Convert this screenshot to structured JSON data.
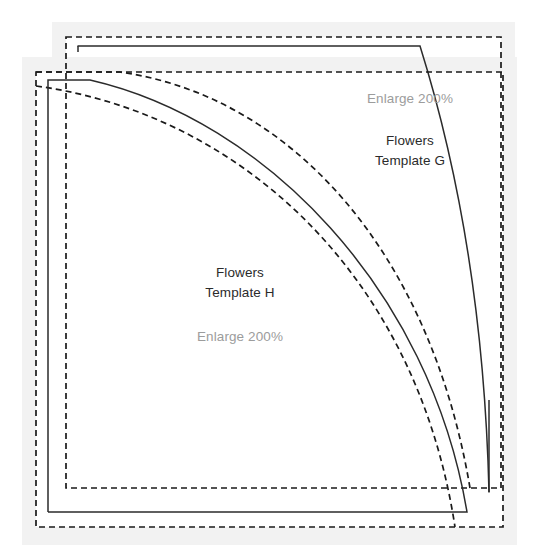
{
  "diagram": {
    "type": "sewing-pattern-template-sheet",
    "colors": {
      "sheet_background": "#f2f2f2",
      "page_background": "#ffffff",
      "stroke": "#2b2b2b",
      "dashed_stroke": "#1a1a1a",
      "title_text": "#2b2b2b",
      "note_text": "#9c9c9c"
    },
    "sheets": [
      {
        "id": "sheet-g",
        "name": "template-sheet-g",
        "title_line1": "Flowers",
        "title_line2": "Template G",
        "note": "Enlarge 200%",
        "paper": {
          "x": 52,
          "y": 22,
          "width": 463,
          "height": 487
        },
        "cut_border": {
          "x": 66,
          "y": 37,
          "width": 435,
          "height": 451
        },
        "solid_corner": {
          "x": 78,
          "y": 46,
          "width": 411,
          "height": 446
        }
      },
      {
        "id": "sheet-h",
        "name": "template-sheet-h",
        "title_line1": "Flowers",
        "title_line2": "Template H",
        "note": "Enlarge 200%",
        "paper": {
          "x": 22,
          "y": 57,
          "width": 495,
          "height": 488
        },
        "cut_border": {
          "x": 36,
          "y": 72,
          "width": 467,
          "height": 455
        },
        "solid_corner": {
          "x": 48,
          "y": 80,
          "width": 442,
          "height": 432
        }
      }
    ],
    "curve_count": 4,
    "curves": [
      {
        "name": "curve-g-solid",
        "style": "solid"
      },
      {
        "name": "curve-g-dashed",
        "style": "dashed"
      },
      {
        "name": "curve-h-dashed",
        "style": "dashed"
      },
      {
        "name": "curve-h-solid",
        "style": "solid"
      }
    ]
  }
}
